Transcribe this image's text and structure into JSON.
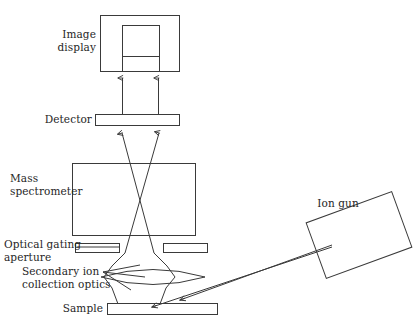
{
  "figure": {
    "background_color": "#ffffff",
    "stroke_color": "#3a3a3a",
    "text_color": "#262626"
  },
  "labels": {
    "image_display": "Image\ndisplay",
    "detector": "Detector",
    "mass_spectrometer": "Mass\nspectrometer",
    "optical_gating_aperture": "Optical gating\naperture",
    "secondary_ion_collection_optics": "Secondary ion\ncollection optics",
    "sample": "Sample",
    "ion_gun": "Ion gun"
  },
  "components": [
    {
      "key": "image-display",
      "label": "Image display",
      "shape": "nested-rectangle",
      "x": 100,
      "y": 15,
      "w": 80,
      "h": 57
    },
    {
      "key": "image-display-inner",
      "label": "Image display screen",
      "shape": "rectangle",
      "x": 122,
      "y": 25,
      "w": 38,
      "h": 47
    },
    {
      "key": "detector",
      "label": "Detector",
      "shape": "bar",
      "x": 95,
      "y": 114,
      "w": 85,
      "h": 11
    },
    {
      "key": "mass-spectrometer",
      "label": "Mass spectrometer",
      "shape": "rectangle",
      "x": 72,
      "y": 163,
      "w": 124,
      "h": 73
    },
    {
      "key": "aperture-left",
      "label": "Optical gating aperture (left)",
      "shape": "bar",
      "x": 75,
      "y": 243,
      "w": 45,
      "h": 10
    },
    {
      "key": "aperture-right",
      "label": "Optical gating aperture (right)",
      "shape": "bar",
      "x": 163,
      "y": 243,
      "w": 45,
      "h": 10
    },
    {
      "key": "collection-lens",
      "label": "Secondary ion collection optics",
      "shape": "biconvex-lens",
      "x": 101,
      "y": 266,
      "w": 104,
      "h": 22
    },
    {
      "key": "sample",
      "label": "Sample",
      "shape": "bar",
      "x": 107,
      "y": 303,
      "w": 111,
      "h": 12
    },
    {
      "key": "ion-gun",
      "label": "Ion gun",
      "shape": "rotated-rectangle",
      "x": 313,
      "y": 205,
      "w": 92,
      "h": 60,
      "rotation_deg": -20
    }
  ],
  "beams": [
    {
      "key": "display-beam-left",
      "label": "signal to display (left)",
      "from": [
        122,
        114
      ],
      "to": [
        122,
        72
      ],
      "arrow": "end"
    },
    {
      "key": "display-beam-right",
      "label": "signal to display (right)",
      "from": [
        158,
        114
      ],
      "to": [
        158,
        72
      ],
      "arrow": "end"
    },
    {
      "key": "detector-beam-left",
      "label": "ion beam to detector (left)",
      "from": [
        160,
        305
      ],
      "to": [
        123,
        126
      ],
      "arrow": "end"
    },
    {
      "key": "detector-beam-right",
      "label": "ion beam to detector (right)",
      "from": [
        118,
        305
      ],
      "to": [
        159,
        126
      ],
      "arrow": "end"
    },
    {
      "key": "primary-beam-upper",
      "label": "primary ion beam (upper)",
      "from": [
        330,
        245
      ],
      "to": [
        176,
        303
      ],
      "arrow": "end"
    },
    {
      "key": "primary-beam-lower",
      "label": "primary ion beam (lower)",
      "from": [
        330,
        245
      ],
      "to": [
        150,
        308
      ],
      "arrow": "end"
    }
  ],
  "leader_lines": [
    {
      "key": "secondary-optics-leader-top",
      "from": [
        103,
        272
      ],
      "to": [
        134,
        266
      ]
    },
    {
      "key": "secondary-optics-leader-middle",
      "from": [
        103,
        272
      ],
      "to": [
        139,
        275
      ]
    },
    {
      "key": "secondary-optics-leader-bottom",
      "from": [
        103,
        272
      ],
      "to": [
        126,
        288
      ]
    },
    {
      "key": "aperture-leader",
      "from": [
        77,
        247
      ],
      "to": [
        120,
        247
      ]
    }
  ]
}
